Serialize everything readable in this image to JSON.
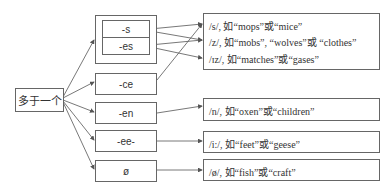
{
  "root": {
    "label": "多于一个"
  },
  "suffixes": [
    {
      "label": "-s"
    },
    {
      "label": "-es"
    },
    {
      "label": "-ce"
    },
    {
      "label": "-en"
    },
    {
      "label": "-ee-"
    },
    {
      "label": "ø"
    }
  ],
  "outcomes": {
    "group_sz": [
      {
        "text": "/s/, 如“mops”或“mice”"
      },
      {
        "text": "/z/, 如“mobs”, “wolves”或 “clothes”"
      },
      {
        "text": "/ɪz/, 如“matches”或“gases”"
      }
    ],
    "en": {
      "text": "/n/, 如“oxen”或“children”"
    },
    "ee": {
      "text": "/i:/, 如“feet”或“geese”"
    },
    "zero": {
      "text": "/ø/, 如“fish”或“craft”"
    }
  },
  "colors": {
    "line": "#555555",
    "border": "#666666"
  }
}
